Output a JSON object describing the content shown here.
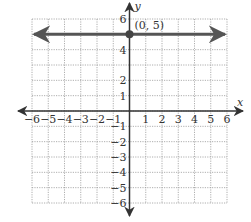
{
  "chart_data": {
    "type": "line",
    "title": "",
    "xlabel": "x",
    "ylabel": "y",
    "xlim": [
      -6,
      6
    ],
    "ylim": [
      -6,
      6
    ],
    "grid": true,
    "grid_style": "dotted",
    "x_ticks": [
      -6,
      -5,
      -4,
      -3,
      -2,
      -1,
      1,
      2,
      3,
      4,
      5,
      6
    ],
    "y_ticks": [
      -6,
      -5,
      -4,
      -3,
      -2,
      -1,
      1,
      2,
      4,
      6
    ],
    "series": [
      {
        "name": "y = 5",
        "kind": "horizontal-line",
        "y": 5,
        "x": [
          -6,
          6
        ],
        "arrows": "both",
        "color": "#555555"
      }
    ],
    "points": [
      {
        "x": 0,
        "y": 5,
        "label": "(0, 5)"
      }
    ],
    "annotations": [
      "(0, 5)"
    ]
  },
  "labels": {
    "x_axis": "x",
    "y_axis": "y",
    "point_label": "(0, 5)"
  },
  "colors": {
    "grid": "#9a9a9a",
    "axis": "#333333",
    "line": "#555555",
    "point": "#444444"
  }
}
